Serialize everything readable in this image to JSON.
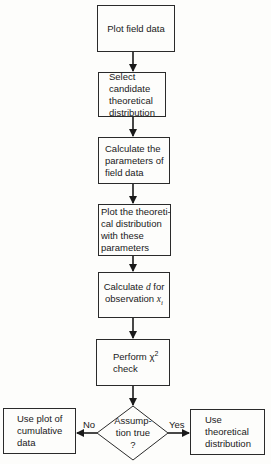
{
  "flowchart": {
    "steps": [
      {
        "id": "plot-field-data",
        "lines": [
          "Plot field data"
        ]
      },
      {
        "id": "select-candidate",
        "lines": [
          "Select",
          "candidate",
          "theoretical",
          "distribution"
        ]
      },
      {
        "id": "calculate-parameters",
        "lines": [
          "Calculate the",
          "parameters of",
          "field data"
        ]
      },
      {
        "id": "plot-theoretical",
        "lines": [
          "Plot the theoreti-",
          "cal distribution",
          "with these",
          "parameters"
        ]
      },
      {
        "id": "calculate-d",
        "line1_prefix": "Calculate ",
        "line1_var": "d",
        "line1_suffix": " for",
        "line2_prefix": "observation ",
        "line2_var": "x",
        "line2_sub": "i"
      },
      {
        "id": "chi-square-check",
        "line1_prefix": "Perform ",
        "line1_symbol": "χ",
        "line1_sup": "2",
        "line2": "check"
      }
    ],
    "decision": {
      "lines": [
        "Assump-",
        "tion true",
        "?"
      ]
    },
    "branches": {
      "no": {
        "label": "No",
        "target_lines": [
          "Use plot of",
          "cumulative",
          "data"
        ]
      },
      "yes": {
        "label": "Yes",
        "target_lines": [
          "Use",
          "theoretical",
          "distribution"
        ]
      }
    }
  },
  "colors": {
    "stroke": "#2a2a2a",
    "background": "#fdfdfb",
    "text": "#1a1a1a"
  }
}
